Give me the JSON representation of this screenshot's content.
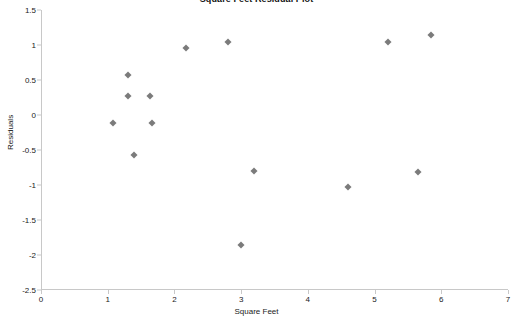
{
  "chart_data": {
    "type": "scatter",
    "title": "Square Feet  Residual Plot",
    "xlabel": "Square Feet",
    "ylabel": "Residuals",
    "xlim": [
      0,
      7
    ],
    "ylim": [
      -2.5,
      1.5
    ],
    "xticks": [
      "0",
      "1",
      "2",
      "3",
      "4",
      "5",
      "6",
      "7"
    ],
    "xtick_values": [
      0,
      1,
      2,
      3,
      4,
      5,
      6,
      7
    ],
    "yticks": [
      "1.5",
      "1",
      "0.5",
      "0",
      "-0.5",
      "-1",
      "-1.5",
      "-2",
      "-2.5"
    ],
    "ytick_values": [
      1.5,
      1,
      0.5,
      0,
      -0.5,
      -1,
      -1.5,
      -2,
      -2.5
    ],
    "grid": false,
    "legend": false,
    "marker": "diamond",
    "marker_color": "#7b7b7b",
    "series": [
      {
        "name": "Residuals",
        "points": [
          {
            "x": 1.08,
            "y": -0.11
          },
          {
            "x": 1.3,
            "y": 0.57
          },
          {
            "x": 1.3,
            "y": 0.27
          },
          {
            "x": 1.4,
            "y": -0.57
          },
          {
            "x": 1.63,
            "y": 0.27
          },
          {
            "x": 1.67,
            "y": -0.11
          },
          {
            "x": 2.18,
            "y": 0.96
          },
          {
            "x": 2.8,
            "y": 1.05
          },
          {
            "x": 3.0,
            "y": -1.85
          },
          {
            "x": 3.2,
            "y": -0.8
          },
          {
            "x": 4.6,
            "y": -1.03
          },
          {
            "x": 5.2,
            "y": 1.05
          },
          {
            "x": 5.65,
            "y": -0.82
          },
          {
            "x": 5.85,
            "y": 1.15
          }
        ]
      }
    ]
  },
  "colors": {
    "axis": "#c8c8c8",
    "text": "#1a1a1a",
    "marker": "#7b7b7b",
    "background": "#ffffff"
  }
}
